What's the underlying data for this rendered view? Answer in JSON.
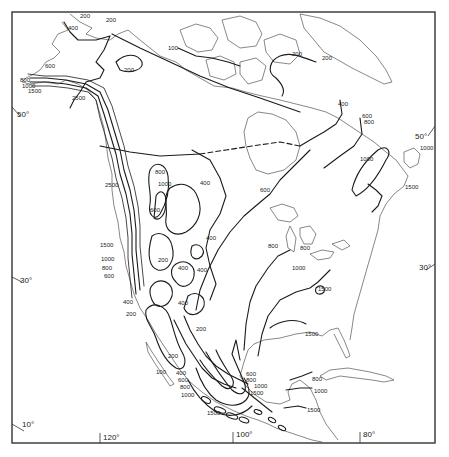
{
  "map": {
    "title": "",
    "region": "North America",
    "frame_color": "#333333",
    "line_color": "#1a1a1a",
    "latitude_labels": {
      "left": [
        {
          "text": "50°"
        },
        {
          "text": "30°"
        },
        {
          "text": "10°"
        }
      ],
      "right": [
        {
          "text": "50°"
        },
        {
          "text": "30°"
        }
      ]
    },
    "longitude_labels": [
      {
        "text": "120°"
      },
      {
        "text": "100°"
      },
      {
        "text": "80°"
      }
    ],
    "contour_labels": {
      "alaska": [
        "200",
        "200",
        "400",
        "600",
        "800",
        "1000",
        "1500",
        "2500",
        "200"
      ],
      "arctic": [
        "100",
        "200",
        "200",
        "400",
        "600",
        "800"
      ],
      "west": [
        "2500",
        "800",
        "1000",
        "600",
        "400",
        "400",
        "1500",
        "1000",
        "800",
        "600",
        "200",
        "400",
        "400",
        "400",
        "200",
        "400",
        "200",
        "100",
        "200"
      ],
      "mexico": [
        "400",
        "600",
        "800",
        "1000",
        "1500",
        "600",
        "800",
        "1000",
        "1500"
      ],
      "central": [
        "600",
        "800",
        "800",
        "1000",
        "1500",
        "1500"
      ],
      "east": [
        "1000",
        "1000",
        "1500"
      ],
      "caribbean": [
        "800",
        "1000",
        "1500"
      ]
    }
  }
}
